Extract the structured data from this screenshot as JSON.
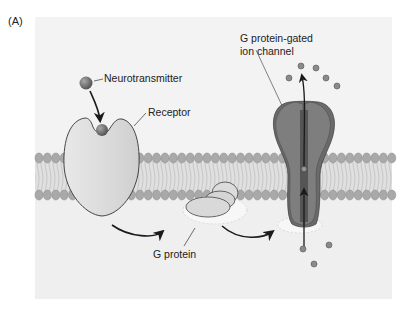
{
  "figure": {
    "panel_label": "(A)"
  },
  "labels": {
    "neurotransmitter": "Neurotransmitter",
    "receptor": "Receptor",
    "g_protein": "G protein",
    "channel_line1": "G protein-gated",
    "channel_line2": "ion channel"
  },
  "colors": {
    "background_panel": "#efefef",
    "cytoplasm": "#e9e9e9",
    "lipid_heads": "#a9a9a9",
    "lipid_tails": "#d4d4d4",
    "receptor": "#dcdcdc",
    "ligand": "#6e6e6e",
    "g_protein": "#d6d6d6",
    "channel": "#7c7c7c",
    "channel_dark": "#5e5e5e",
    "ions": "#8a8a8a",
    "arrows": "#1a1a1a"
  }
}
